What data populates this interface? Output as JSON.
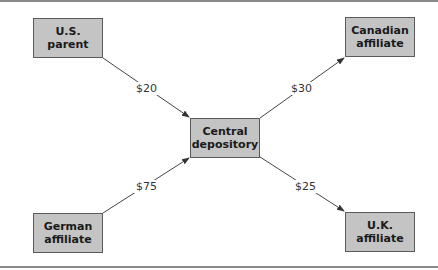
{
  "diagram": {
    "nodes": [
      {
        "id": "us_parent",
        "line1": "U.S.",
        "line2": "parent"
      },
      {
        "id": "canadian_affiliate",
        "line1": "Canadian",
        "line2": "affiliate"
      },
      {
        "id": "central_depository",
        "line1": "Central",
        "line2": "depository"
      },
      {
        "id": "german_affiliate",
        "line1": "German",
        "line2": "affiliate"
      },
      {
        "id": "uk_affiliate",
        "line1": "U.K.",
        "line2": "affiliate"
      }
    ],
    "edges": [
      {
        "from": "us_parent",
        "to": "central_depository",
        "label": "$20"
      },
      {
        "from": "german_affiliate",
        "to": "central_depository",
        "label": "$75"
      },
      {
        "from": "central_depository",
        "to": "canadian_affiliate",
        "label": "$30"
      },
      {
        "from": "central_depository",
        "to": "uk_affiliate",
        "label": "$25"
      }
    ]
  },
  "colors": {
    "box_fill": "#c4c4c4",
    "box_border": "#5a5a5a",
    "arrow": "#333333"
  }
}
